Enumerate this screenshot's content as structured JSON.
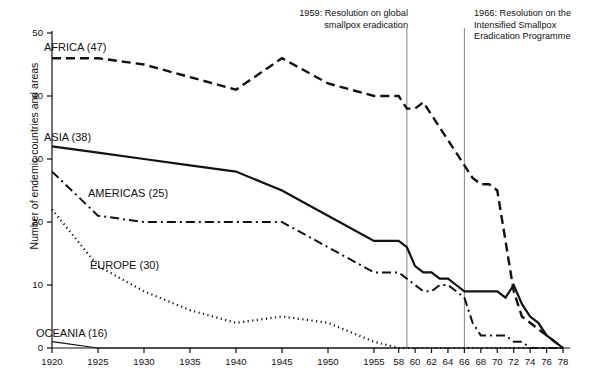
{
  "chart_data": {
    "type": "line",
    "title": "",
    "xlabel": "",
    "ylabel": "Number of endemic countries and areas",
    "ylim": [
      0,
      50
    ],
    "yticks": [
      0,
      10,
      20,
      30,
      40,
      50
    ],
    "xticks": [
      "1920",
      "1925",
      "1930",
      "1935",
      "1940",
      "1945",
      "1950",
      "1955",
      "58",
      "60",
      "62",
      "64",
      "66",
      "68",
      "70",
      "72",
      "74",
      "76",
      "78"
    ],
    "grid": false,
    "legend_position": "inline-labels",
    "annotations": [
      {
        "name": "marker-1959",
        "year": 1959,
        "text": "1959: Resolution on global\nsmallpox eradication"
      },
      {
        "name": "marker-1966",
        "year": 1966,
        "text": "1966: Resolution on the\nIntensified Smallpox\nEradication Programme"
      }
    ],
    "series": [
      {
        "name": "AFRICA",
        "label": "AFRICA (47)",
        "total": 47,
        "style": "dashed",
        "x": [
          1920,
          1925,
          1930,
          1935,
          1940,
          1945,
          1950,
          1955,
          1958,
          1959,
          1960,
          1961,
          1962,
          1963,
          1964,
          1965,
          1966,
          1967,
          1968,
          1969,
          1970,
          1971,
          1972,
          1973,
          1974,
          1975,
          1976,
          1977,
          1978
        ],
        "values": [
          46,
          46,
          45,
          43,
          41,
          46,
          42,
          40,
          40,
          38,
          38,
          39,
          37,
          35,
          33,
          31,
          29,
          27,
          26,
          26,
          25,
          17,
          9,
          5,
          4,
          3,
          2,
          1,
          0
        ]
      },
      {
        "name": "ASIA",
        "label": "ASIA (38)",
        "total": 38,
        "style": "solid",
        "x": [
          1920,
          1925,
          1930,
          1935,
          1940,
          1945,
          1950,
          1955,
          1958,
          1959,
          1960,
          1961,
          1962,
          1963,
          1964,
          1965,
          1966,
          1967,
          1968,
          1969,
          1970,
          1971,
          1972,
          1973,
          1974,
          1975,
          1976,
          1977,
          1978
        ],
        "values": [
          32,
          31,
          30,
          29,
          28,
          25,
          21,
          17,
          17,
          16,
          13,
          12,
          12,
          11,
          11,
          10,
          9,
          9,
          9,
          9,
          9,
          8,
          10,
          7,
          5,
          4,
          2,
          1,
          0
        ]
      },
      {
        "name": "AMERICAS",
        "label": "AMERICAS (25)",
        "total": 25,
        "style": "dashdot",
        "x": [
          1920,
          1925,
          1930,
          1935,
          1940,
          1945,
          1950,
          1955,
          1958,
          1959,
          1960,
          1961,
          1962,
          1963,
          1964,
          1965,
          1966,
          1967,
          1968,
          1969,
          1970,
          1971,
          1972,
          1973,
          1974,
          1975,
          1976,
          1977,
          1978
        ],
        "values": [
          28,
          21,
          20,
          20,
          20,
          20,
          16,
          12,
          12,
          11,
          10,
          9,
          9,
          10,
          10,
          9,
          8,
          4,
          2,
          2,
          2,
          2,
          1,
          1,
          0,
          0,
          0,
          0,
          0
        ]
      },
      {
        "name": "EUROPE",
        "label": "EUROPE (30)",
        "total": 30,
        "style": "dotted",
        "x": [
          1920,
          1925,
          1930,
          1935,
          1940,
          1945,
          1950,
          1955,
          1958,
          1960,
          1962,
          1964,
          1966,
          1968,
          1970,
          1972,
          1974,
          1976,
          1978
        ],
        "values": [
          22,
          13,
          9,
          6,
          4,
          5,
          4,
          1,
          0,
          0,
          0,
          0,
          0,
          0,
          0,
          0,
          0,
          0,
          0
        ]
      },
      {
        "name": "OCEANIA",
        "label": "OCEANIA (16)",
        "total": 16,
        "style": "solid-thin",
        "x": [
          1920,
          1925,
          1930,
          1935,
          1940,
          1945,
          1950,
          1955,
          1958,
          1966,
          1970,
          1974,
          1978
        ],
        "values": [
          1,
          0,
          0,
          0,
          0,
          0,
          0,
          0,
          0,
          0,
          0,
          0,
          0
        ]
      }
    ]
  }
}
